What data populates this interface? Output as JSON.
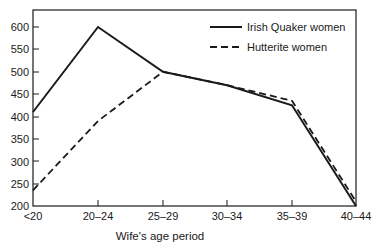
{
  "chart_data": {
    "type": "line",
    "title": "",
    "xlabel": "Wife's age period",
    "ylabel": "",
    "categories": [
      "<20",
      "20–24",
      "25–29",
      "30–34",
      "35–39",
      "40–44"
    ],
    "series": [
      {
        "name": "Irish Quaker women",
        "style": "solid",
        "values": [
          410,
          600,
          500,
          470,
          425,
          200
        ]
      },
      {
        "name": "Hutterite women",
        "style": "dashed",
        "values": [
          235,
          390,
          500,
          470,
          435,
          210
        ]
      }
    ],
    "yticks": [
      200,
      250,
      300,
      350,
      400,
      450,
      500,
      550,
      600
    ],
    "ylim": [
      200,
      640
    ],
    "grid": false,
    "legend_position": "upper right"
  },
  "legend": {
    "items": [
      {
        "label": "Irish Quaker women",
        "style": "solid"
      },
      {
        "label": "Hutterite women",
        "style": "dashed"
      }
    ]
  },
  "axis": {
    "xlabel": "Wife's age period",
    "yticks": [
      "600",
      "550",
      "500",
      "450",
      "400",
      "350",
      "300",
      "250",
      "200"
    ],
    "xticks": [
      "<20",
      "20–24",
      "25–29",
      "30–34",
      "35–39",
      "40–44"
    ]
  },
  "colors": {
    "line": "#1a1a1a",
    "background": "#ffffff"
  }
}
